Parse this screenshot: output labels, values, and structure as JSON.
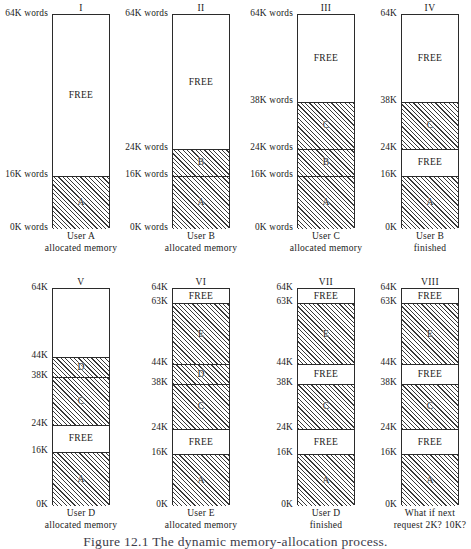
{
  "figure": {
    "caption": "Figure 12.1   The dynamic memory-allocation process.",
    "units_note": "K words"
  },
  "panels": [
    {
      "id": "panel-1",
      "title": "I",
      "caption_line1": "User A",
      "caption_line2": "allocated memory",
      "ticks": [
        {
          "label": "64K words",
          "value": 64
        },
        {
          "label": "16K words",
          "value": 16
        },
        {
          "label": "0K words",
          "value": 0
        }
      ],
      "bands": [
        {
          "name": "FREE",
          "from": 16,
          "to": 64,
          "state": "free"
        },
        {
          "name": "A",
          "from": 0,
          "to": 16,
          "state": "used"
        }
      ]
    },
    {
      "id": "panel-2",
      "title": "II",
      "caption_line1": "User B",
      "caption_line2": "allocated memory",
      "ticks": [
        {
          "label": "64K words",
          "value": 64
        },
        {
          "label": "24K words",
          "value": 24
        },
        {
          "label": "16K words",
          "value": 16
        },
        {
          "label": "0K words",
          "value": 0
        }
      ],
      "bands": [
        {
          "name": "FREE",
          "from": 24,
          "to": 64,
          "state": "free"
        },
        {
          "name": "B",
          "from": 16,
          "to": 24,
          "state": "used"
        },
        {
          "name": "A",
          "from": 0,
          "to": 16,
          "state": "used"
        }
      ]
    },
    {
      "id": "panel-3",
      "title": "III",
      "caption_line1": "User C",
      "caption_line2": "allocated memory",
      "ticks": [
        {
          "label": "64K words",
          "value": 64
        },
        {
          "label": "38K words",
          "value": 38
        },
        {
          "label": "24K words",
          "value": 24
        },
        {
          "label": "16K words",
          "value": 16
        },
        {
          "label": "0K words",
          "value": 0
        }
      ],
      "bands": [
        {
          "name": "FREE",
          "from": 38,
          "to": 64,
          "state": "free"
        },
        {
          "name": "C",
          "from": 24,
          "to": 38,
          "state": "used"
        },
        {
          "name": "B",
          "from": 16,
          "to": 24,
          "state": "used"
        },
        {
          "name": "A",
          "from": 0,
          "to": 16,
          "state": "used"
        }
      ]
    },
    {
      "id": "panel-4",
      "title": "IV",
      "caption_line1": "User B",
      "caption_line2": "finished",
      "ticks": [
        {
          "label": "64K",
          "value": 64
        },
        {
          "label": "38K",
          "value": 38
        },
        {
          "label": "24K",
          "value": 24
        },
        {
          "label": "16K",
          "value": 16
        },
        {
          "label": "0K",
          "value": 0
        }
      ],
      "bands": [
        {
          "name": "FREE",
          "from": 38,
          "to": 64,
          "state": "free"
        },
        {
          "name": "C",
          "from": 24,
          "to": 38,
          "state": "used"
        },
        {
          "name": "FREE",
          "from": 16,
          "to": 24,
          "state": "free"
        },
        {
          "name": "A",
          "from": 0,
          "to": 16,
          "state": "used"
        }
      ]
    },
    {
      "id": "panel-5",
      "title": "V",
      "caption_line1": "User D",
      "caption_line2": "allocated memory",
      "ticks": [
        {
          "label": "64K",
          "value": 64
        },
        {
          "label": "44K",
          "value": 44
        },
        {
          "label": "38K",
          "value": 38
        },
        {
          "label": "24K",
          "value": 24
        },
        {
          "label": "16K",
          "value": 16
        },
        {
          "label": "0K",
          "value": 0
        }
      ],
      "bands": [
        {
          "name": "",
          "from": 44,
          "to": 64,
          "state": "free"
        },
        {
          "name": "D",
          "from": 38,
          "to": 44,
          "state": "used"
        },
        {
          "name": "C",
          "from": 24,
          "to": 38,
          "state": "used"
        },
        {
          "name": "FREE",
          "from": 16,
          "to": 24,
          "state": "free"
        },
        {
          "name": "A",
          "from": 0,
          "to": 16,
          "state": "used"
        }
      ]
    },
    {
      "id": "panel-6",
      "title": "VI",
      "caption_line1": "User E",
      "caption_line2": "allocated memory",
      "ticks": [
        {
          "label": "64K",
          "value": 64
        },
        {
          "label": "63K",
          "value": 63
        },
        {
          "label": "44K",
          "value": 44
        },
        {
          "label": "38K",
          "value": 38
        },
        {
          "label": "24K",
          "value": 24
        },
        {
          "label": "16K",
          "value": 16
        },
        {
          "label": "0K",
          "value": 0
        }
      ],
      "bands": [
        {
          "name": "FREE",
          "from": 63,
          "to": 64,
          "state": "free"
        },
        {
          "name": "E",
          "from": 44,
          "to": 63,
          "state": "used"
        },
        {
          "name": "D",
          "from": 38,
          "to": 44,
          "state": "used"
        },
        {
          "name": "C",
          "from": 24,
          "to": 38,
          "state": "used"
        },
        {
          "name": "FREE",
          "from": 16,
          "to": 24,
          "state": "free"
        },
        {
          "name": "A",
          "from": 0,
          "to": 16,
          "state": "used"
        }
      ]
    },
    {
      "id": "panel-7",
      "title": "VII",
      "caption_line1": "User D",
      "caption_line2": "finished",
      "ticks": [
        {
          "label": "64K",
          "value": 64
        },
        {
          "label": "63K",
          "value": 63
        },
        {
          "label": "44K",
          "value": 44
        },
        {
          "label": "38K",
          "value": 38
        },
        {
          "label": "24K",
          "value": 24
        },
        {
          "label": "16K",
          "value": 16
        },
        {
          "label": "0K",
          "value": 0
        }
      ],
      "bands": [
        {
          "name": "FREE",
          "from": 63,
          "to": 64,
          "state": "free"
        },
        {
          "name": "E",
          "from": 44,
          "to": 63,
          "state": "used"
        },
        {
          "name": "FREE",
          "from": 38,
          "to": 44,
          "state": "free"
        },
        {
          "name": "C",
          "from": 24,
          "to": 38,
          "state": "used"
        },
        {
          "name": "FREE",
          "from": 16,
          "to": 24,
          "state": "free"
        },
        {
          "name": "A",
          "from": 0,
          "to": 16,
          "state": "used"
        }
      ]
    },
    {
      "id": "panel-8",
      "title": "VIII",
      "caption_line1": "What if next",
      "caption_line2": "request 2K? 10K?",
      "ticks": [
        {
          "label": "64K",
          "value": 64
        },
        {
          "label": "63K",
          "value": 63
        },
        {
          "label": "44K",
          "value": 44
        },
        {
          "label": "38K",
          "value": 38
        },
        {
          "label": "24K",
          "value": 24
        },
        {
          "label": "16K",
          "value": 16
        },
        {
          "label": "0K",
          "value": 0
        }
      ],
      "bands": [
        {
          "name": "FREE",
          "from": 63,
          "to": 64,
          "state": "free"
        },
        {
          "name": "E",
          "from": 44,
          "to": 63,
          "state": "used"
        },
        {
          "name": "FREE",
          "from": 38,
          "to": 44,
          "state": "free"
        },
        {
          "name": "C",
          "from": 24,
          "to": 38,
          "state": "used"
        },
        {
          "name": "FREE",
          "from": 16,
          "to": 24,
          "state": "free"
        },
        {
          "name": "A",
          "from": 0,
          "to": 16,
          "state": "used"
        }
      ]
    }
  ],
  "layout": {
    "rows": [
      {
        "top": 14,
        "bottom": 228,
        "caption_top": 231
      },
      {
        "top": 288,
        "bottom": 505,
        "caption_top": 508
      }
    ],
    "columns": [
      {
        "left": 52,
        "width": 58
      },
      {
        "left": 172,
        "width": 58
      },
      {
        "left": 297,
        "width": 58
      },
      {
        "left": 401,
        "width": 58
      }
    ],
    "panel_placement": [
      {
        "row": 0,
        "col": 0
      },
      {
        "row": 0,
        "col": 1
      },
      {
        "row": 0,
        "col": 2
      },
      {
        "row": 0,
        "col": 3
      },
      {
        "row": 1,
        "col": 0
      },
      {
        "row": 1,
        "col": 1
      },
      {
        "row": 1,
        "col": 2
      },
      {
        "row": 1,
        "col": 3
      }
    ],
    "kink": {
      "note": "the 63K-64K band is drawn exaggerated",
      "min_band_px": 14
    },
    "caption_y": 534
  }
}
